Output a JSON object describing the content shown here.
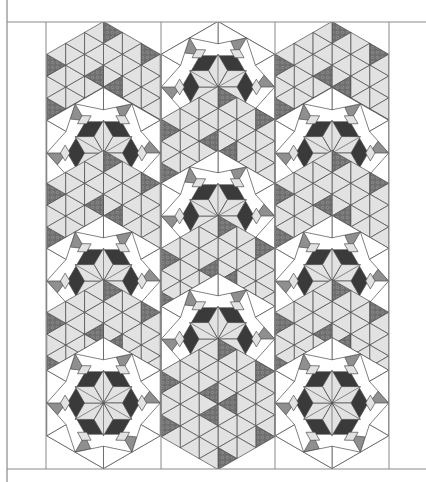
{
  "figure": {
    "kind": "quilt-layout-diagram",
    "width": 426,
    "height": 482,
    "frame": {
      "left_x": 7,
      "top_y": 22,
      "bottom_y": 469,
      "right_x": 426,
      "column_lines_x": [
        46,
        161,
        275,
        389
      ],
      "line_color": "#8a8a8a"
    },
    "hex": {
      "radius": 65.5,
      "columns_center_x": [
        103.5,
        218,
        332
      ],
      "column_rows": [
        [
          {
            "cy": 87,
            "block": "triangle-hex"
          },
          {
            "cy": 153,
            "block": "star-hex"
          },
          {
            "cy": 216,
            "block": "triangle-hex"
          },
          {
            "cy": 281,
            "block": "star-hex"
          },
          {
            "cy": 345,
            "block": "triangle-hex"
          },
          {
            "cy": 403,
            "block": "star-hex"
          }
        ],
        [
          {
            "cy": 87,
            "block": "star-hex"
          },
          {
            "cy": 152,
            "block": "triangle-hex"
          },
          {
            "cy": 216,
            "block": "star-hex"
          },
          {
            "cy": 281,
            "block": "triangle-hex"
          },
          {
            "cy": 339,
            "block": "star-hex"
          },
          {
            "cy": 404,
            "block": "triangle-hex"
          }
        ],
        [
          {
            "cy": 87,
            "block": "triangle-hex"
          },
          {
            "cy": 153,
            "block": "star-hex"
          },
          {
            "cy": 216,
            "block": "triangle-hex"
          },
          {
            "cy": 281,
            "block": "star-hex"
          },
          {
            "cy": 345,
            "block": "triangle-hex"
          },
          {
            "cy": 403,
            "block": "star-hex"
          }
        ]
      ]
    },
    "colors": {
      "background": "#ffffff",
      "light_fill": "#e2e2e2",
      "medium_fill": "#8f8f8f",
      "dark_fill": "#3a3a3a",
      "print_fill": "#6e6e6e",
      "print_dot": "#9a9a9a",
      "white_fill": "#ffffff",
      "stroke": "#4a4a4a"
    }
  }
}
